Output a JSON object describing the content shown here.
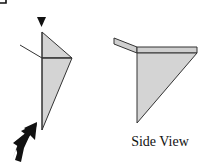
{
  "diagram": {
    "type": "origami-fold-step",
    "colors": {
      "paper_fill": "#d4d4d4",
      "band_fill": "#cfcfcf",
      "outline": "#333333",
      "arrow": "#111111",
      "background": "#ffffff"
    },
    "front_view": {
      "valley_marker": "down-triangle-marker",
      "push_arrow": "push-arrow",
      "crease_line": "reference-line"
    },
    "side_view": {
      "caption": "Side View"
    }
  }
}
